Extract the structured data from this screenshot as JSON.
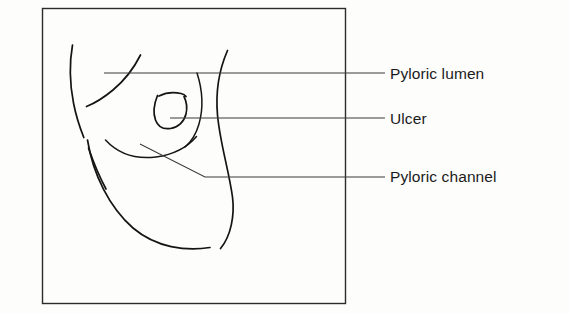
{
  "figure": {
    "kind": "hand-drawn line diagram",
    "background_color": "#fdfdfc",
    "ink_color": "#141414",
    "frame": {
      "name": "diagram-border",
      "x": 42,
      "y": 8,
      "width": 303,
      "height": 295,
      "stroke_color": "#2c2c2c"
    },
    "labels": [
      {
        "id": "pyloric-lumen",
        "text": "Pyloric lumen",
        "text_x": 390,
        "text_y": 79,
        "leader": {
          "x1": 104,
          "y1": 73,
          "x2": 385,
          "y2": 73
        }
      },
      {
        "id": "ulcer",
        "text": "Ulcer",
        "text_x": 390,
        "text_y": 124,
        "leader": {
          "x1": 170,
          "y1": 118,
          "x2": 385,
          "y2": 118
        }
      },
      {
        "id": "pyloric-channel",
        "text": "Pyloric channel",
        "text_x": 390,
        "text_y": 182,
        "leader": {
          "x1": 140,
          "y1": 144,
          "bend_x": 205,
          "bend_y": 177,
          "x2": 385,
          "y2": 177
        }
      }
    ],
    "strokes": [
      {
        "id": "left-outer-wall-upper",
        "desc": "long left gastric wall curve, upper segment"
      },
      {
        "id": "left-outer-wall-lower",
        "desc": "long left gastric wall curve, lower segment after break"
      },
      {
        "id": "lesser-curve-fold",
        "desc": "upper fold descending from top toward left wall"
      },
      {
        "id": "greater-curve-sweep",
        "desc": "large sweeping curve forming the antral floor"
      },
      {
        "id": "right-wall-curve",
        "desc": "right-hand gastric wall curve descending to the pylorus"
      },
      {
        "id": "antral-fold-arc",
        "desc": "shallow arc across the antrum below the ulcer"
      },
      {
        "id": "ulcer-crater",
        "desc": "small U-shaped ulcer crater outline"
      },
      {
        "id": "ulcer-crater-lip",
        "desc": "short upper lip stroke of the ulcer crater"
      },
      {
        "id": "pyloric-ring-curve",
        "desc": "short inner curve marking the pyloric ring"
      }
    ]
  }
}
